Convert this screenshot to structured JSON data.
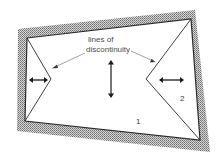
{
  "diagram": {
    "annotation": {
      "line1": "lines of",
      "line2": "discontinuity"
    },
    "regions": {
      "region_1": "1",
      "region_2": "2"
    },
    "colors": {
      "hatch_dark": "#7a7a7a",
      "hatch_light": "#d8d8d8",
      "line": "#2a2a2a",
      "pointer": "#8a8a8a",
      "background": "#ffffff"
    }
  }
}
